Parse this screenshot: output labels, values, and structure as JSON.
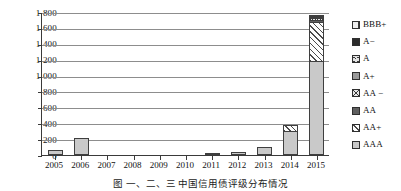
{
  "chart_data": {
    "type": "bar",
    "subtype": "stacked-bar",
    "title": "",
    "xlabel": "",
    "ylabel": "",
    "ylim": [
      0,
      1800
    ],
    "ytick_step": 200,
    "ytick_labels": [
      "0",
      "200",
      "400",
      "600",
      "800",
      "1 000",
      "1 200",
      "1 400",
      "1 600",
      "1 800"
    ],
    "ytick_values": [
      0,
      200,
      400,
      600,
      800,
      1000,
      1200,
      1400,
      1600,
      1800
    ],
    "grid": true,
    "grid_axis": "y",
    "legend_position": "right",
    "categories": [
      "2005",
      "2006",
      "2007",
      "2008",
      "2009",
      "2010",
      "2011",
      "2012",
      "2013",
      "2014",
      "2015"
    ],
    "series": [
      {
        "name": "AAA",
        "values": [
          60,
          210,
          0,
          0,
          0,
          0,
          10,
          35,
          95,
          300,
          1180
        ]
      },
      {
        "name": "AA+",
        "values": [
          0,
          0,
          0,
          0,
          0,
          0,
          0,
          0,
          0,
          80,
          500
        ]
      },
      {
        "name": "AA",
        "values": [
          0,
          0,
          0,
          0,
          0,
          0,
          0,
          0,
          0,
          0,
          25
        ]
      },
      {
        "name": "AA-",
        "values": [
          0,
          0,
          0,
          0,
          0,
          0,
          0,
          0,
          0,
          0,
          15
        ]
      },
      {
        "name": "A+",
        "values": [
          0,
          0,
          0,
          0,
          0,
          0,
          0,
          0,
          0,
          0,
          10
        ]
      },
      {
        "name": "A",
        "values": [
          0,
          0,
          0,
          0,
          0,
          0,
          0,
          0,
          0,
          0,
          5
        ]
      },
      {
        "name": "A-",
        "values": [
          0,
          0,
          0,
          0,
          0,
          0,
          0,
          0,
          0,
          0,
          5
        ]
      },
      {
        "name": "BBB+",
        "values": [
          0,
          0,
          0,
          0,
          0,
          0,
          0,
          0,
          0,
          0,
          0
        ]
      }
    ],
    "totals": [
      60,
      210,
      0,
      0,
      0,
      0,
      10,
      35,
      95,
      380,
      1740
    ]
  },
  "legend": {
    "items": [
      {
        "label": "BBB+",
        "key": "BBBplus",
        "swatch": "swatch-bbb-plus"
      },
      {
        "label": "A−",
        "key": "Aminus",
        "swatch": "swatch-a-minus"
      },
      {
        "label": "A",
        "key": "A",
        "swatch": "swatch-a"
      },
      {
        "label": "A+",
        "key": "Aplus",
        "swatch": "swatch-a-plus"
      },
      {
        "label": "AA −",
        "key": "AAminus",
        "swatch": "swatch-aa-minus"
      },
      {
        "label": "AA",
        "key": "AA",
        "swatch": "swatch-aa"
      },
      {
        "label": "AA+",
        "key": "AAplus",
        "swatch": "swatch-aa-plus"
      },
      {
        "label": "AAA",
        "key": "AAA",
        "swatch": "swatch-aaa"
      }
    ]
  },
  "caption": {
    "text": "图  一、二、三  中国信用债评级分布情况"
  },
  "colors": {
    "axis": "#3a3a3a",
    "grid": "#8d8d8d",
    "bar_outline": "#3f3f3f",
    "aaa_fill": "#c9c9c9",
    "aa_fill": "#5f5f5f",
    "aplus_fill": "#9a9a9a",
    "aminus_fill": "#2c2c2c",
    "background": "#ffffff"
  }
}
